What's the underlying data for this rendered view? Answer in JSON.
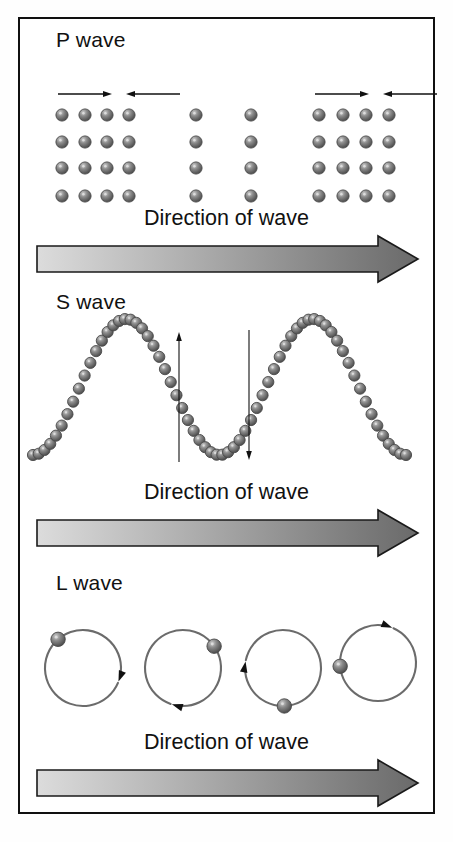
{
  "figure": {
    "caption_absent": true,
    "border_color": "#101010",
    "background": "#ffffff"
  },
  "palette": {
    "particle_fill": "#8a8a8a",
    "particle_dark": "#4a4a4a",
    "particle_highlight": "#cfcfcf",
    "arrow_stroke": "#111111",
    "banner_light": "#d8d8d8",
    "banner_dark": "#6e6e6e",
    "banner_outline": "#1a1a1a",
    "circle_stroke": "#6b6b6b",
    "text_color": "#111111"
  },
  "sections": [
    {
      "id": "p-wave",
      "title": "P wave",
      "direction_label": "Direction of wave",
      "description": "Compressional wave: particles bunched into compressed bands separated by rarefied gaps",
      "wave_type": "compressional",
      "particle_rows": 4,
      "row_y": [
        95,
        122,
        148,
        176
      ],
      "column_x": [
        62,
        85,
        107,
        129,
        196,
        251,
        319,
        343,
        366,
        389
      ],
      "compression_bands": [
        {
          "label": "compression-left",
          "columns_x": [
            62,
            85,
            107,
            129
          ]
        },
        {
          "label": "rarefaction-center",
          "columns_x": [
            196,
            251
          ]
        },
        {
          "label": "compression-right",
          "columns_x": [
            319,
            343,
            366,
            389
          ]
        }
      ],
      "motion_arrows": [
        {
          "name": "compression-arrow-left-1",
          "direction": "right",
          "x1": 58,
          "x2": 112,
          "y": 74
        },
        {
          "name": "compression-arrow-left-2",
          "direction": "left",
          "x1": 180,
          "x2": 126,
          "y": 74
        },
        {
          "name": "compression-arrow-right-1",
          "direction": "right",
          "x1": 315,
          "x2": 369,
          "y": 74
        },
        {
          "name": "compression-arrow-right-2",
          "direction": "left",
          "x1": 437,
          "x2": 383,
          "y": 74
        }
      ]
    },
    {
      "id": "s-wave",
      "title": "S wave",
      "direction_label": "Direction of wave",
      "description": "Transverse wave: particles form a sine curve, motion perpendicular to travel direction",
      "wave_type": "transverse",
      "sine": {
        "x_start": 33,
        "x_end": 406,
        "baseline_y": 105,
        "amplitude": 68,
        "cycles": 2,
        "phase_deg": 90,
        "sphere_count": 66,
        "sphere_radius": 5.6
      },
      "motion_arrows": [
        {
          "name": "s-wave-up-arrow",
          "direction": "up",
          "x": 179,
          "y_tail": 180,
          "y_head": 50
        },
        {
          "name": "s-wave-down-arrow",
          "direction": "down",
          "x": 249,
          "y_tail": 48,
          "y_head": 178
        }
      ]
    },
    {
      "id": "l-wave",
      "title": "L wave",
      "direction_label": "Direction of wave",
      "description": "Surface (Love/Rayleigh) wave: particles trace circular orbits at successive phases",
      "wave_type": "surface-circular",
      "circles": [
        {
          "name": "orbit-1",
          "cx": 83,
          "cy": 105,
          "r": 38,
          "particle_angle_deg": 131,
          "arrow_angle_deg": 339,
          "arrow_dir": "clockwise"
        },
        {
          "name": "orbit-2",
          "cx": 183,
          "cy": 105,
          "r": 38,
          "particle_angle_deg": 35,
          "arrow_angle_deg": 253,
          "arrow_dir": "clockwise"
        },
        {
          "name": "orbit-3",
          "cx": 283,
          "cy": 105,
          "r": 38,
          "particle_angle_deg": 272,
          "arrow_angle_deg": 170,
          "arrow_dir": "clockwise"
        },
        {
          "name": "orbit-4",
          "cx": 378,
          "cy": 100,
          "r": 38,
          "particle_angle_deg": 185,
          "arrow_angle_deg": 68,
          "arrow_dir": "clockwise"
        }
      ]
    }
  ],
  "banner": {
    "label": "Direction of wave",
    "shape": "right-pointing-block-arrow",
    "gradient_from": "#dcdcdc",
    "gradient_to": "#6a6a6a",
    "outline": "#1a1a1a"
  }
}
